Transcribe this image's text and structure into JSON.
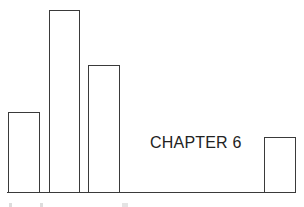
{
  "title": "CHAPTER 6",
  "decoration": {
    "type": "bar-motif",
    "stroke_color": "#3a3a3a",
    "fill_color": "#ffffff",
    "baseline_y": 192,
    "bars": [
      {
        "left": 8,
        "width": 32,
        "top": 112
      },
      {
        "left": 49,
        "width": 31,
        "top": 10
      },
      {
        "left": 88,
        "width": 32,
        "top": 65
      },
      {
        "left": 264,
        "width": 32,
        "top": 137
      }
    ]
  }
}
